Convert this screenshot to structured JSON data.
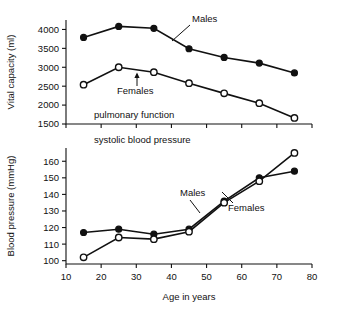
{
  "figure": {
    "background": "#ffffff",
    "ink_color": "#111111"
  },
  "chart_data": [
    {
      "type": "line",
      "id": "pulmonary-function",
      "title": "",
      "subtitle": "pulmonary function",
      "xlabel": "",
      "ylabel": "Vital capacity (ml)",
      "x": [
        15,
        25,
        35,
        45,
        55,
        65,
        75
      ],
      "xlim": [
        10,
        80
      ],
      "xticks": [
        10,
        20,
        30,
        40,
        50,
        60,
        70,
        80
      ],
      "xticklabels": [
        "10",
        "20",
        "30",
        "40",
        "50",
        "60",
        "70",
        "80"
      ],
      "ylim": [
        1500,
        4250
      ],
      "yticks": [
        1500,
        2000,
        2500,
        3000,
        3500,
        4000
      ],
      "yticklabels": [
        "1500",
        "2000",
        "2500",
        "3000",
        "3500",
        "4000"
      ],
      "grid": false,
      "legend": "annotations",
      "series": [
        {
          "name": "Males",
          "marker": "filled-circle",
          "values": [
            3790,
            4080,
            4030,
            3490,
            3260,
            3110,
            2850
          ]
        },
        {
          "name": "Females",
          "marker": "open-circle",
          "values": [
            2540,
            3000,
            2870,
            2580,
            2310,
            2050,
            1660
          ]
        }
      ],
      "annotations": [
        {
          "text": "Males",
          "points_to_series": "Males"
        },
        {
          "text": "Females",
          "points_to_series": "Females"
        },
        {
          "text": "pulmonary function",
          "points_to_series": ""
        }
      ]
    },
    {
      "type": "line",
      "id": "systolic-blood-pressure",
      "title": "",
      "subtitle": "systolic blood pressure",
      "xlabel": "Age in years",
      "ylabel": "Blood pressure (mmHg)",
      "x": [
        15,
        25,
        35,
        45,
        55,
        65,
        75
      ],
      "xlim": [
        10,
        80
      ],
      "xticks": [
        10,
        20,
        30,
        40,
        50,
        60,
        70,
        80
      ],
      "xticklabels": [
        "10",
        "20",
        "30",
        "40",
        "50",
        "60",
        "70",
        "80"
      ],
      "ylim": [
        98,
        168
      ],
      "yticks": [
        100,
        110,
        120,
        130,
        140,
        150,
        160
      ],
      "yticklabels": [
        "100",
        "110",
        "120",
        "130",
        "140",
        "150",
        "160"
      ],
      "grid": false,
      "legend": "annotations",
      "series": [
        {
          "name": "Males",
          "marker": "filled-circle",
          "values": [
            117,
            119,
            116,
            119,
            136,
            150,
            154
          ]
        },
        {
          "name": "Females",
          "marker": "open-circle",
          "values": [
            102,
            114,
            113,
            117.5,
            135,
            148,
            165
          ]
        }
      ],
      "annotations": [
        {
          "text": "Males",
          "points_to_series": "Males"
        },
        {
          "text": "Females",
          "points_to_series": "Females"
        },
        {
          "text": "systolic blood pressure",
          "points_to_series": ""
        }
      ]
    }
  ]
}
